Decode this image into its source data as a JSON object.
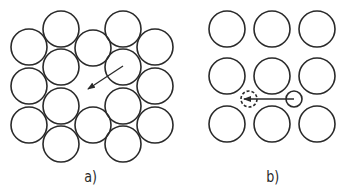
{
  "figure_a": {
    "label": "a)",
    "description": "Close-packed hexagonal arrangement with a vacancy; arrow shows atom moving into vacancy",
    "atom_radius": 18,
    "atoms": [
      [
        29,
        47
      ],
      [
        29,
        86
      ],
      [
        29,
        125
      ],
      [
        61,
        29
      ],
      [
        61,
        67
      ],
      [
        61,
        106
      ],
      [
        61,
        144
      ],
      [
        93,
        48
      ],
      [
        93,
        125
      ],
      [
        123,
        29
      ],
      [
        123,
        67
      ],
      [
        123,
        106
      ],
      [
        123,
        144
      ],
      [
        155,
        47
      ],
      [
        155,
        86
      ],
      [
        155,
        125
      ]
    ],
    "arrow": {
      "from": [
        123,
        66
      ],
      "to": [
        88,
        89
      ]
    }
  },
  "figure_b": {
    "label": "b)",
    "description": "Square lattice with interstitial atom moving to a new interstitial site (dashed)",
    "atom_radius": 18,
    "atoms": [
      [
        227,
        29
      ],
      [
        272,
        29
      ],
      [
        317,
        29
      ],
      [
        227,
        76
      ],
      [
        272,
        76
      ],
      [
        317,
        76
      ],
      [
        227,
        124
      ],
      [
        272,
        124
      ],
      [
        317,
        124
      ]
    ],
    "interstitial": {
      "center": [
        294,
        99
      ],
      "r": 8
    },
    "interstitial_target": {
      "center": [
        249,
        99
      ],
      "r": 8,
      "style": "dashed"
    },
    "arrow": {
      "from": [
        294,
        99
      ],
      "to": [
        244,
        99
      ]
    }
  },
  "colors": {
    "stroke": "#2a2a2a",
    "background": "#ffffff"
  }
}
